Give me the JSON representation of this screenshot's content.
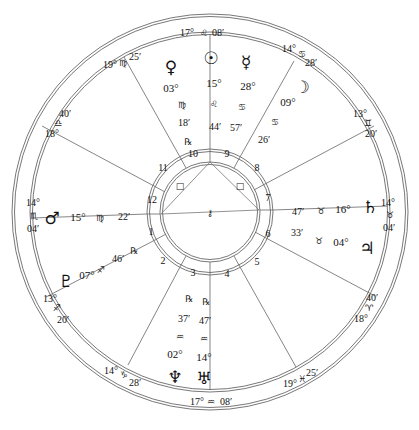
{
  "chart": {
    "center": [
      210,
      212
    ],
    "rings": {
      "outer_outer": 198,
      "outer_inner": 194,
      "mid_outer": 180,
      "mid_inner": 176,
      "inner_outer": 62,
      "inner_inner": 58,
      "innermost_outer": 50,
      "innermost_inner": 47
    },
    "line_color": "#555555"
  },
  "cusps": [
    {
      "id": "mc",
      "label_deg": "17°",
      "sign": "♌",
      "label_min": "08′",
      "sign_name": "Leo"
    },
    {
      "id": "c11",
      "label_deg": "19°",
      "sign": "♍",
      "label_min": "25′",
      "sign_name": "Virgo"
    },
    {
      "id": "c12",
      "label_deg": "18°",
      "sign": "♎",
      "label_min": "40′",
      "sign_name": "Libra"
    },
    {
      "id": "asc",
      "label_deg": "14°",
      "sign": "♏",
      "label_min": "04′",
      "sign_name": "Scorpio"
    },
    {
      "id": "c2",
      "label_deg": "13°",
      "sign": "♐",
      "label_min": "20′",
      "sign_name": "Sagittarius"
    },
    {
      "id": "c3",
      "label_deg": "14°",
      "sign": "♑",
      "label_min": "28′",
      "sign_name": "Capricorn"
    },
    {
      "id": "ic",
      "label_deg": "17°",
      "sign": "♒",
      "label_min": "08′",
      "sign_name": "Aquarius"
    },
    {
      "id": "c5",
      "label_deg": "19°",
      "sign": "♓",
      "label_min": "25′",
      "sign_name": "Pisces"
    },
    {
      "id": "c6",
      "label_deg": "18°",
      "sign": "♈",
      "label_min": "40′",
      "sign_name": "Aries"
    },
    {
      "id": "dsc",
      "label_deg": "14°",
      "sign": "♉",
      "label_min": "04′",
      "sign_name": "Taurus"
    },
    {
      "id": "c8",
      "label_deg": "13°",
      "sign": "♊",
      "label_min": "20′",
      "sign_name": "Gemini"
    },
    {
      "id": "c9",
      "label_deg": "14°",
      "sign": "♋",
      "label_min": "28′",
      "sign_name": "Cancer"
    }
  ],
  "houses": [
    "1",
    "2",
    "3",
    "4",
    "5",
    "6",
    "7",
    "8",
    "9",
    "10",
    "11",
    "12"
  ],
  "planets": [
    {
      "name": "Venus",
      "glyph": "♀",
      "deg": "03°",
      "sign": "♍",
      "min": "18′",
      "retro": "℞"
    },
    {
      "name": "Sun",
      "glyph": "☉",
      "deg": "15°",
      "sign": "♌",
      "min": "44′",
      "retro": ""
    },
    {
      "name": "Mercury",
      "glyph": "☿",
      "deg": "28°",
      "sign": "♋",
      "min": "57′",
      "retro": ""
    },
    {
      "name": "Moon",
      "glyph": "☽",
      "deg": "09°",
      "sign": "♋",
      "min": "26′",
      "retro": ""
    },
    {
      "name": "Saturn",
      "glyph": "♄",
      "deg": "16°",
      "sign": "♉",
      "min": "47′",
      "retro": ""
    },
    {
      "name": "Jupiter",
      "glyph": "♃",
      "deg": "04°",
      "sign": "♉",
      "min": "33′",
      "retro": ""
    },
    {
      "name": "Mars",
      "glyph": "♂",
      "deg": "15°",
      "sign": "♍",
      "min": "22′",
      "retro": ""
    },
    {
      "name": "Pluto",
      "glyph": "♇",
      "deg": "07°",
      "sign": "♐",
      "min": "46′",
      "retro": "℞"
    },
    {
      "name": "Neptune",
      "glyph": "♆",
      "deg": "02°",
      "sign": "♒",
      "min": "37′",
      "retro": "℞"
    },
    {
      "name": "Uranus",
      "glyph": "♅",
      "deg": "14°",
      "sign": "♒",
      "min": "47′",
      "retro": "℞"
    }
  ],
  "aspects": [
    {
      "from": "asc",
      "to": "mc",
      "symbol": "□"
    },
    {
      "from": "mc",
      "to": "dsc",
      "symbol": "□"
    },
    {
      "from": "asc",
      "to": "dsc",
      "symbol": "☍"
    }
  ],
  "center_glyph": "⚷"
}
